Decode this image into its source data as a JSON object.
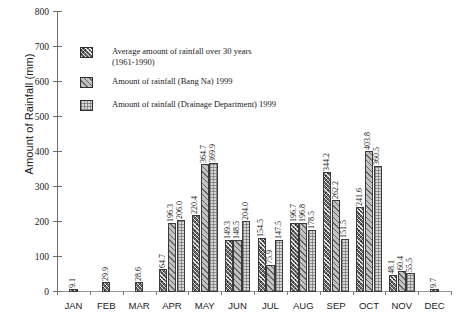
{
  "chart_data": {
    "type": "bar",
    "title": "",
    "xlabel": "",
    "ylabel": "Amount of Rainfall (mm)",
    "ylim": [
      0,
      800
    ],
    "yticks": [
      0,
      100,
      200,
      300,
      400,
      500,
      600,
      700,
      800
    ],
    "grid": false,
    "legend_position": "upper-left-inside",
    "categories": [
      "JAN",
      "FEB",
      "MAR",
      "APR",
      "MAY",
      "JUN",
      "JUL",
      "AUG",
      "SEP",
      "OCT",
      "NOV",
      "DEC"
    ],
    "series": [
      {
        "name": "Average amount of rainfall over 30 years (1961-1990)",
        "pattern": "dark-crosshatch",
        "values": [
          9.1,
          29.9,
          28.6,
          64.7,
          220.4,
          149.3,
          154.5,
          196.7,
          344.2,
          241.6,
          48.1,
          9.7
        ]
      },
      {
        "name": "Amount of rainfall (Bang Na) 1999",
        "pattern": "light-diagonal",
        "values": [
          null,
          null,
          null,
          196.3,
          364.7,
          148.5,
          75.9,
          196.8,
          262.2,
          403.8,
          60.4,
          null
        ]
      },
      {
        "name": "Amount of rainfall (Drainage Department) 1999",
        "pattern": "light-grid",
        "values": [
          null,
          null,
          null,
          206.0,
          369.9,
          204.0,
          147.5,
          178.5,
          151.5,
          360.5,
          55.5,
          null
        ]
      }
    ]
  },
  "legend": {
    "items": [
      {
        "label_line1": "Average amount of rainfall over 30 years",
        "label_line2": "(1961-1990)"
      },
      {
        "label_line1": "Amount of rainfall (Bang Na) 1999",
        "label_line2": ""
      },
      {
        "label_line1": "Amount of rainfall (Drainage Department) 1999",
        "label_line2": ""
      }
    ]
  },
  "axes": {
    "y_title": "Amount of Rainfall (mm)"
  }
}
